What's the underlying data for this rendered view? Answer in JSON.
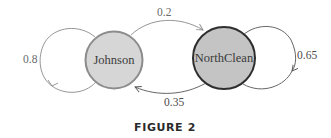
{
  "diagram": {
    "type": "state-transition",
    "nodes": [
      {
        "id": "johnson",
        "label": "Johnson",
        "fill": "#d6d6d6",
        "stroke": "#8c8c8c"
      },
      {
        "id": "northclean",
        "label": "NorthClean",
        "fill": "#c4c4c4",
        "stroke": "#2e2e2e"
      }
    ],
    "edges": [
      {
        "from": "johnson",
        "to": "johnson",
        "label": "0.8"
      },
      {
        "from": "johnson",
        "to": "northclean",
        "label": "0.2"
      },
      {
        "from": "northclean",
        "to": "johnson",
        "label": "0.35"
      },
      {
        "from": "northclean",
        "to": "northclean",
        "label": "0.65"
      }
    ],
    "caption": "FIGURE 2"
  }
}
